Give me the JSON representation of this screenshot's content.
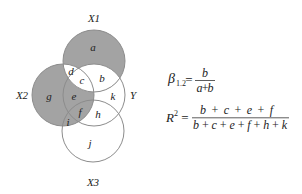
{
  "diagram": {
    "colors": {
      "shaded": "#a3a3a3",
      "unshaded": "#ffffff",
      "outline": "#8c8c8c",
      "text": "#222222"
    },
    "circles": {
      "x1": {
        "label": "X1"
      },
      "x2": {
        "label": "X2"
      },
      "y": {
        "label": "Y"
      },
      "x3": {
        "label": "X3"
      }
    },
    "regions": {
      "a": {
        "label": "a",
        "shaded": true
      },
      "b": {
        "label": "b",
        "shaded": false
      },
      "c": {
        "label": "c",
        "shaded": false
      },
      "d": {
        "label": "d",
        "shaded": false
      },
      "e": {
        "label": "e",
        "shaded": true
      },
      "f": {
        "label": "f",
        "shaded": true
      },
      "g": {
        "label": "g",
        "shaded": true
      },
      "h": {
        "label": "h",
        "shaded": false
      },
      "i": {
        "label": "i",
        "shaded": true
      },
      "j": {
        "label": "j",
        "shaded": false
      },
      "k": {
        "label": "k",
        "shaded": false
      }
    }
  },
  "formulas": {
    "beta": {
      "symbol": "β",
      "subscript": "1.2",
      "equals": "=",
      "numerator": "b",
      "denominator": "a+b"
    },
    "r_squared": {
      "symbol": "R",
      "superscript": "2",
      "equals": "=",
      "numerator": "b+c+e+f",
      "denominator": "b+c+e+f+h+k"
    }
  }
}
